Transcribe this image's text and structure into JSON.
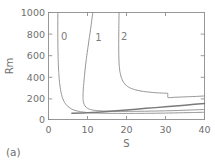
{
  "figure": {
    "panel_label": "(a)",
    "background": "#ffffff",
    "line_color": "#8f8f8f",
    "axis_color": "#8d8d8d",
    "text_color": "#6f6f6f"
  },
  "chart_data": {
    "type": "line",
    "title": "",
    "subtitle": "",
    "panel": "(a)",
    "xlabel": "S",
    "ylabel": "Rm",
    "xlim": [
      0,
      40
    ],
    "ylim": [
      0,
      1000
    ],
    "xticks": [
      0,
      10,
      20,
      30,
      40
    ],
    "xticklabels": [
      "0",
      "10",
      "20",
      "30",
      "40"
    ],
    "yticks": [
      0,
      200,
      400,
      600,
      800,
      1000
    ],
    "yticklabels": [
      "0",
      "200",
      "400",
      "600",
      "800",
      "1000"
    ],
    "grid": false,
    "legend_position": "inline-curve-labels",
    "annotations": [
      {
        "text": "0",
        "x": 3.2,
        "y": 745
      },
      {
        "text": "1",
        "x": 12.0,
        "y": 735
      },
      {
        "text": "2",
        "x": 18.6,
        "y": 740
      }
    ],
    "series": [
      {
        "name": "0",
        "label": "0",
        "description": "n=0 marginal stability branch: vertical asymptote near S=2.3, knee near Rm=100, flattens to Rm~55-60",
        "x": [
          2.4,
          2.38,
          2.4,
          2.48,
          2.62,
          2.85,
          3.15,
          3.55,
          4.1,
          4.8,
          5.7,
          6.8,
          8.2,
          10.0,
          12.5,
          15.0,
          18.0,
          22.0,
          26.0,
          30.0,
          34.0,
          37.0,
          40.0
        ],
        "y": [
          1000,
          860,
          700,
          560,
          440,
          340,
          265,
          205,
          160,
          128,
          102,
          85,
          73,
          65,
          60,
          58,
          57,
          57,
          58,
          60,
          63,
          65,
          68
        ]
      },
      {
        "name": "1",
        "label": "1",
        "description": "n=1 branch: slanted asymptote from S=11.3 at Rm=1000 to S=8.8 near Rm=210, knee then flattens to Rm~75",
        "x": [
          11.35,
          11.1,
          10.8,
          10.45,
          10.1,
          9.75,
          9.45,
          9.2,
          9.0,
          8.88,
          8.85,
          8.92,
          9.15,
          9.6,
          10.3,
          11.2,
          12.4,
          14.0,
          16.0,
          18.5,
          21.0,
          24.0,
          27.0,
          30.0,
          33.0,
          36.0,
          40.0
        ],
        "y": [
          1000,
          930,
          845,
          760,
          670,
          580,
          490,
          400,
          320,
          255,
          205,
          170,
          140,
          116,
          99,
          89,
          83,
          79,
          77,
          76,
          76,
          77,
          79,
          81,
          84,
          88,
          94
        ]
      },
      {
        "name": "2",
        "label": "2",
        "description": "n=2 branch: near-vertical at S=18 down to Rm=380, knee curving right, plateau ~245, downward step at S=30.6 to Rm=205, then gentle rise to Rm~220",
        "x": [
          18.1,
          18.05,
          18.02,
          18.0,
          18.02,
          18.1,
          18.3,
          18.65,
          19.2,
          20.0,
          21.1,
          22.4,
          24.0,
          25.8,
          27.6,
          29.2,
          30.4,
          30.6,
          30.62,
          32.0,
          34.0,
          36.0,
          38.0,
          40.0
        ],
        "y": [
          1000,
          900,
          800,
          700,
          610,
          520,
          450,
          395,
          350,
          315,
          292,
          276,
          264,
          256,
          250,
          247,
          245,
          245,
          205,
          207,
          210,
          213,
          216,
          220
        ]
      },
      {
        "name": "envelope",
        "label": "",
        "description": "lower thick envelope line rising linearly from Rm~58 near S=6 to Rm~150 at S=40",
        "x": [
          6.0,
          10.0,
          15.0,
          20.0,
          25.0,
          30.0,
          35.0,
          40.0
        ],
        "y": [
          58,
          63,
          75,
          89,
          104,
          118,
          134,
          150
        ]
      }
    ]
  }
}
